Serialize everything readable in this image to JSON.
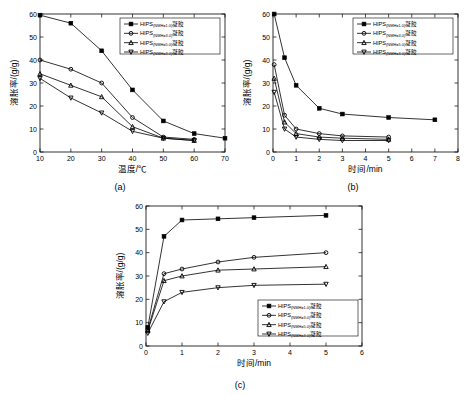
{
  "figure": {
    "panel_a_caption": "(a)",
    "panel_b_caption": "(b)",
    "panel_c_caption": "(c)"
  },
  "chart_data": [
    {
      "id": "a",
      "type": "line",
      "title": "",
      "xlabel": "温度/℃",
      "ylabel": "溶胀率/(g/g)",
      "xlim": [
        10,
        70
      ],
      "ylim": [
        0,
        60
      ],
      "xticks": [
        10,
        20,
        30,
        40,
        50,
        60,
        70
      ],
      "yticks": [
        0,
        10,
        20,
        30,
        40,
        50,
        60
      ],
      "grid": false,
      "legend_position": "top-right",
      "series": [
        {
          "name": "HIPS(NMH=1.0)凝胶",
          "marker": "square",
          "color": "#000000",
          "x": [
            10,
            20,
            30,
            40,
            50,
            60,
            70
          ],
          "y": [
            59.5,
            56.0,
            44.0,
            27.0,
            13.5,
            8.0,
            6.0
          ]
        },
        {
          "name": "HIPS(NMH=3.0)凝胶",
          "marker": "circle",
          "color": "#000000",
          "x": [
            10,
            20,
            30,
            40,
            50,
            60
          ],
          "y": [
            40.0,
            36.0,
            30.0,
            15.0,
            6.5,
            5.5
          ]
        },
        {
          "name": "HIPS(NMH=5.0)凝胶",
          "marker": "triangle",
          "color": "#000000",
          "x": [
            10,
            20,
            30,
            40,
            50,
            60
          ],
          "y": [
            34.0,
            29.0,
            24.0,
            11.0,
            6.0,
            5.0
          ]
        },
        {
          "name": "HIPS(NMH=3.0)凝胶",
          "marker": "inverted-triangle",
          "color": "#000000",
          "x": [
            10,
            20,
            30,
            40,
            50,
            60
          ],
          "y": [
            32.0,
            23.5,
            17.0,
            9.0,
            6.0,
            5.0
          ]
        }
      ],
      "legend": [
        "HIPS(NMH=1.0)凝胶",
        "HIPS(NMH=3.0)凝胶",
        "HIPS(NMH=5.0)凝胶",
        "HIPS(NMH=3.0)凝胶"
      ]
    },
    {
      "id": "b",
      "type": "line",
      "title": "",
      "xlabel": "时间/min",
      "ylabel": "溶胀率/(g/g)",
      "xlim": [
        0,
        8
      ],
      "ylim": [
        0,
        60
      ],
      "xticks": [
        0,
        1,
        2,
        3,
        4,
        5,
        6,
        7,
        8
      ],
      "yticks": [
        0,
        10,
        20,
        30,
        40,
        50,
        60
      ],
      "grid": false,
      "legend_position": "top-right",
      "series": [
        {
          "name": "HIPS(NMH=1.0)凝胶",
          "marker": "square",
          "color": "#000000",
          "x": [
            0.05,
            0.5,
            1.0,
            2.0,
            3.0,
            5.0,
            7.0
          ],
          "y": [
            60.0,
            41.0,
            29.0,
            19.0,
            16.5,
            15.0,
            14.0
          ]
        },
        {
          "name": "HIPS(NMH=3.0)凝胶",
          "marker": "circle",
          "color": "#000000",
          "x": [
            0.05,
            0.5,
            1.0,
            2.0,
            3.0,
            5.0
          ],
          "y": [
            38.0,
            16.0,
            10.0,
            8.0,
            7.0,
            6.5
          ]
        },
        {
          "name": "HIPS(NMH=5.0)凝胶",
          "marker": "triangle",
          "color": "#000000",
          "x": [
            0.05,
            0.5,
            1.0,
            2.0,
            3.0,
            5.0
          ],
          "y": [
            32.0,
            13.0,
            8.0,
            6.5,
            6.0,
            5.5
          ]
        },
        {
          "name": "HIPS(NMH=3.0)凝胶",
          "marker": "inverted-triangle",
          "color": "#000000",
          "x": [
            0.05,
            0.5,
            1.0,
            2.0,
            3.0,
            5.0
          ],
          "y": [
            26.0,
            10.0,
            6.5,
            5.5,
            5.0,
            5.0
          ]
        }
      ],
      "legend": [
        "HIPS(NMH=1.0)凝胶",
        "HIPS(NMH=3.0)凝胶",
        "HIPS(NMH=5.0)凝胶",
        "HIPS(NMH=3.0)凝胶"
      ]
    },
    {
      "id": "c",
      "type": "line",
      "title": "",
      "xlabel": "时间/min",
      "ylabel": "溶胀率/(g/g)",
      "xlim": [
        0,
        6
      ],
      "ylim": [
        0,
        60
      ],
      "xticks": [
        0,
        1,
        2,
        3,
        4,
        5,
        6
      ],
      "yticks": [
        0,
        10,
        20,
        30,
        40,
        50,
        60
      ],
      "grid": false,
      "legend_position": "bottom-right",
      "series": [
        {
          "name": "HIPS(NMH=1.0)凝胶",
          "marker": "square",
          "color": "#000000",
          "x": [
            0.05,
            0.5,
            1.0,
            2.0,
            3.0,
            5.0
          ],
          "y": [
            8.0,
            47.0,
            54.0,
            54.5,
            55.0,
            56.0
          ]
        },
        {
          "name": "HIPS(NMH=3.0)凝胶",
          "marker": "circle",
          "color": "#000000",
          "x": [
            0.05,
            0.5,
            1.0,
            2.0,
            3.0,
            5.0
          ],
          "y": [
            7.0,
            31.0,
            33.0,
            36.0,
            38.0,
            40.0
          ]
        },
        {
          "name": "HIPS(NMH=5.0)凝胶",
          "marker": "triangle",
          "color": "#000000",
          "x": [
            0.05,
            0.5,
            1.0,
            2.0,
            3.0,
            5.0
          ],
          "y": [
            6.5,
            28.0,
            30.0,
            32.5,
            33.0,
            34.0
          ]
        },
        {
          "name": "HIPS(NMH=3.0)凝胶",
          "marker": "inverted-triangle",
          "color": "#000000",
          "x": [
            0.05,
            0.5,
            1.0,
            2.0,
            3.0,
            5.0
          ],
          "y": [
            5.5,
            19.0,
            23.0,
            25.0,
            26.0,
            26.5
          ]
        }
      ],
      "legend": [
        "HIPS(NMH=1.0)凝胶",
        "HIPS(NMH=3.0)凝胶",
        "HIPS(NMH=5.0)凝胶",
        "HIPS(NMH=3.0)凝胶"
      ]
    }
  ],
  "legend_labels": {
    "base": "HIPS",
    "sub_a1": "(NMH=1.0)",
    "sub_a2": "(NMH=3.0)",
    "sub_a3": "(NMH=5.0)",
    "sub_a4": "(NMH=3.0)",
    "suffix": "凝胶"
  }
}
